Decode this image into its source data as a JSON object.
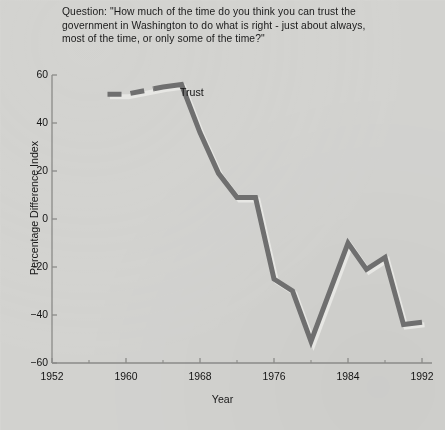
{
  "question": {
    "text": "Question: \"How much of the time do you think you can trust the\ngovernment in Washington to do what is right - just about always,\nmost of the time, or only some of the time?\""
  },
  "chart_data": {
    "type": "line",
    "title": "",
    "xlabel": "Year",
    "ylabel": "Percentage Difference Index",
    "xlim": [
      1952,
      1993
    ],
    "ylim": [
      -60,
      60
    ],
    "xticks": [
      1952,
      1960,
      1968,
      1976,
      1984,
      1992
    ],
    "xtick_labels": [
      "1952",
      "1960",
      "1968",
      "1976",
      "1984",
      "1992"
    ],
    "yticks": [
      60,
      40,
      20,
      0,
      -20,
      -40,
      -60
    ],
    "ytick_labels": [
      "60",
      "40",
      "20",
      "0",
      "-20",
      "-40",
      "-60"
    ],
    "grid": false,
    "series": [
      {
        "name": "Trust",
        "annotation": "Trust",
        "color": "#6f6f6f",
        "linewidth": 5,
        "x": [
          1958,
          1960,
          1964,
          1966,
          1968,
          1970,
          1972,
          1974,
          1976,
          1978,
          1980,
          1984,
          1986,
          1988,
          1990,
          1992
        ],
        "values": [
          52,
          52,
          55,
          56,
          36,
          19,
          9,
          9,
          -25,
          -30,
          -51,
          -10,
          -21,
          -16,
          -44,
          -43
        ],
        "dashed_segment_x": [
          1958,
          1963
        ],
        "dashed_note": "leading segment drawn as dashes"
      }
    ]
  },
  "colors": {
    "background": "#d6d6d3",
    "line": "#6f6f6f",
    "line_shadow": "#e8e8e5",
    "axis": "#8a8a88",
    "text": "#1a1a1a"
  }
}
